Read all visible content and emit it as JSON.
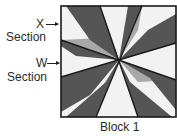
{
  "diagram": {
    "caption": "Block 1",
    "labels": {
      "x_letter": "X",
      "x_section": "Section",
      "w_letter": "W",
      "w_section": "Section"
    },
    "colors": {
      "dark": "#555555",
      "medium": "#a8a8a8",
      "light": "#f2f2f2",
      "outline": "#1a1a1a"
    },
    "block": {
      "x": 61,
      "y": 6,
      "width": 115,
      "height": 111,
      "center": [
        119,
        60
      ],
      "seam_lines": [
        {
          "from": [
            100,
            6
          ],
          "to": [
            138,
            117
          ]
        },
        {
          "from": [
            142,
            6
          ],
          "to": [
            96,
            117
          ]
        },
        {
          "from": [
            61,
            40
          ],
          "to": [
            176,
            80
          ]
        },
        {
          "from": [
            61,
            77
          ],
          "to": [
            176,
            43
          ]
        }
      ]
    }
  }
}
